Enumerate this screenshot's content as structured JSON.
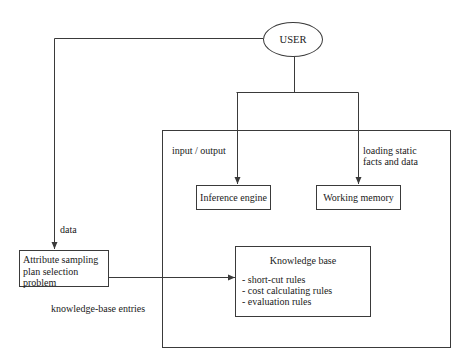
{
  "diagram": {
    "nodes": {
      "user": {
        "label": "USER"
      },
      "inference_engine": {
        "label": "Inference engine"
      },
      "working_memory": {
        "label": "Working memory"
      },
      "attribute_sampling": {
        "lines": [
          "Attribute sampling",
          "plan selection",
          "problem"
        ]
      },
      "knowledge_base": {
        "title": "Knowledge base",
        "items": [
          "- short-cut rules",
          "- cost calculating rules",
          "- evaluation rules"
        ]
      }
    },
    "edge_labels": {
      "input_output": "input / output",
      "loading_static": [
        "loading static",
        "facts and data"
      ],
      "data": "data",
      "knowledge_base_entries": "knowledge-base entries"
    },
    "colors": {
      "line": "#3a3a3a",
      "background": "#ffffff",
      "text": "#1a1a1a"
    }
  }
}
